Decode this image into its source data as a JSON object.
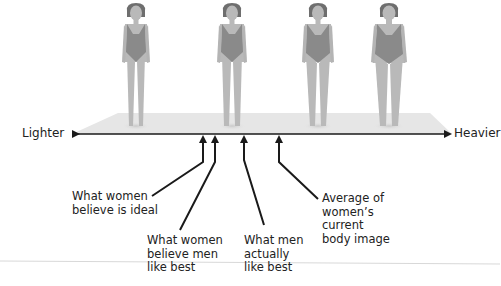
{
  "axis": {
    "left_label": "Lighter",
    "right_label": "Heavier"
  },
  "figures": [
    {
      "name": "figure-thinnest",
      "x": 136,
      "build": "thin"
    },
    {
      "name": "figure-slim",
      "x": 232,
      "build": "slim"
    },
    {
      "name": "figure-average",
      "x": 318,
      "build": "average"
    },
    {
      "name": "figure-heaviest",
      "x": 389,
      "build": "heavy"
    }
  ],
  "annotations": [
    {
      "id": "women-ideal",
      "text": "What women\nbelieve is ideal",
      "arrow_x": 203
    },
    {
      "id": "women-believe-men",
      "text": "What women\nbelieve men\nlike best",
      "arrow_x": 215
    },
    {
      "id": "men-actually",
      "text": "What men\nactually\nlike best",
      "arrow_x": 244
    },
    {
      "id": "women-current",
      "text": "Average of\nwomen’s\ncurrent\nbody image",
      "arrow_x": 279
    }
  ],
  "colors": {
    "platform": "#e6e6e6",
    "axis": "#1a1a1a",
    "skin": "#b9b9b9",
    "swimsuit": "#8a8a8a",
    "hair": "#6e6e6e",
    "divider": "#d8d8d8"
  }
}
